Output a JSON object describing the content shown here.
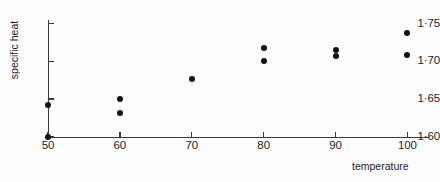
{
  "chart_data": {
    "type": "scatter",
    "title": "",
    "xlabel": "temperature",
    "ylabel": "specific heat",
    "xlim": [
      50,
      103
    ],
    "ylim": [
      1.6,
      1.755
    ],
    "grid": false,
    "legend": null,
    "x_ticks": [
      50,
      60,
      70,
      80,
      90,
      100
    ],
    "x_tick_labels": [
      "50",
      "60",
      "70",
      "80",
      "90",
      "100"
    ],
    "y_ticks": [
      1.6,
      1.65,
      1.7,
      1.75
    ],
    "y_tick_labels": [
      "1·60",
      "1·65",
      "1·70",
      "1·75"
    ],
    "points": [
      {
        "x": 50,
        "y": 1.6
      },
      {
        "x": 50,
        "y": 1.642
      },
      {
        "x": 60,
        "y": 1.65
      },
      {
        "x": 60,
        "y": 1.632
      },
      {
        "x": 70,
        "y": 1.676
      },
      {
        "x": 80,
        "y": 1.718
      },
      {
        "x": 80,
        "y": 1.7
      },
      {
        "x": 90,
        "y": 1.715
      },
      {
        "x": 90,
        "y": 1.707
      },
      {
        "x": 100,
        "y": 1.738
      },
      {
        "x": 100,
        "y": 1.708
      }
    ],
    "marker_color": "#121212",
    "axis_color": "#3a3a3a",
    "background_color": "#fdfdfd"
  }
}
